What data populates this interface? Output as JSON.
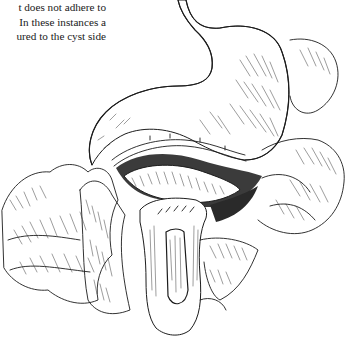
{
  "page": {
    "text_lines": [
      "t does not adhere to",
      "In these instances a",
      "ured to the cyst side"
    ]
  },
  "figure": {
    "colors": {
      "ink": "#1c1c1c",
      "background": "#ffffff"
    }
  }
}
